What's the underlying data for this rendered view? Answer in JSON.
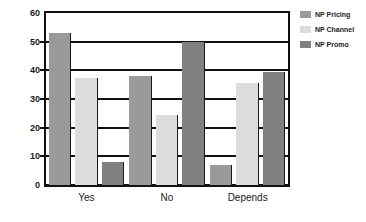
{
  "chart_data": {
    "type": "bar",
    "title": "",
    "subtitle": "",
    "xlabel": "",
    "ylabel": "",
    "categories": [
      "Yes",
      "No",
      "Depends"
    ],
    "series": [
      {
        "name": "NP Pricing",
        "color": "#9a9a9a",
        "values": [
          53,
          38,
          7
        ]
      },
      {
        "name": "NP Channel",
        "color": "#dcdcdc",
        "values": [
          37.5,
          24.5,
          35.5
        ]
      },
      {
        "name": "NP Promo",
        "color": "#808080",
        "values": [
          8,
          50,
          39.5
        ]
      }
    ],
    "ylim": [
      0,
      60
    ],
    "yticks": [
      0,
      10,
      20,
      30,
      40,
      50,
      60
    ],
    "ytick_labels": [
      "0",
      "10",
      "20",
      "30",
      "40",
      "50",
      "60"
    ],
    "grid": true,
    "grid_axis": "y",
    "legend_position": "right",
    "legend_border": false,
    "plot_border_color": "#111111",
    "background_color": "#ffffff"
  },
  "legend": {
    "items": [
      {
        "label": "NP Pricing"
      },
      {
        "label": "NP Channel"
      },
      {
        "label": "NP Promo"
      }
    ]
  },
  "axes": {
    "y_tick_labels": [
      "60",
      "50",
      "40",
      "30",
      "20",
      "10",
      "0"
    ],
    "x_tick_labels": [
      "Yes",
      "No",
      "Depends"
    ]
  }
}
